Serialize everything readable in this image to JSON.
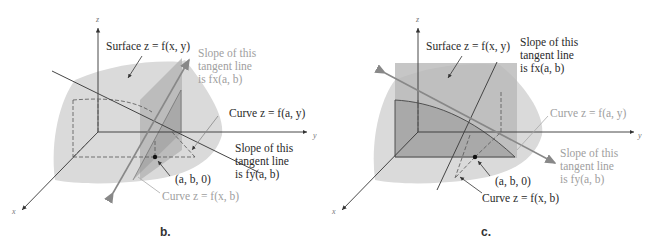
{
  "panels": [
    {
      "id": "b",
      "caption": "b.",
      "axes": {
        "x": "x",
        "y": "y",
        "z": "z"
      },
      "labels": {
        "surface": "Surface z = f(x, y)",
        "slope_x": [
          "Slope of this",
          "tangent line",
          "is fx(a, b)"
        ],
        "curve_ay": "Curve z = f(a, y)",
        "slope_y": [
          "Slope of this",
          "tangent line",
          "is fy(a, b)"
        ],
        "point": "(a, b, 0)",
        "curve_xb": "Curve z = f(x, b)"
      },
      "highlighted": "slope_x"
    },
    {
      "id": "c",
      "caption": "c.",
      "axes": {
        "x": "x",
        "y": "y",
        "z": "z"
      },
      "labels": {
        "surface": "Surface z = f(x, y)",
        "slope_x": [
          "Slope of this",
          "tangent line",
          "is fx(a, b)"
        ],
        "curve_ay": "Curve z = f(a, y)",
        "slope_y": [
          "Slope of this",
          "tangent line",
          "is fy(a, b)"
        ],
        "point": "(a, b, 0)",
        "curve_xb": "Curve z = f(x, b)"
      },
      "highlighted": "slope_y"
    }
  ],
  "colors": {
    "surface": "#d9d9d9",
    "plane": "#b4b4b4",
    "plane_dark": "#a6a6a6",
    "arrow_gray": "#8a8a8a",
    "line_dark": "#444444",
    "text_dark": "#2a2a2a",
    "text_gray": "#a0a0a0"
  }
}
